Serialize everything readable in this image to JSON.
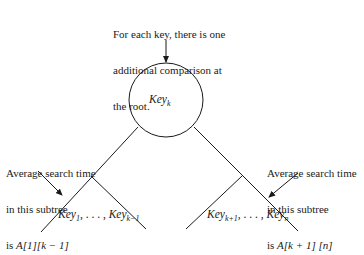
{
  "top_note": {
    "lines": [
      "For each key, there is one",
      "additional comparison at",
      "the root."
    ]
  },
  "root": {
    "base": "Key",
    "sub": "k"
  },
  "left_note": {
    "line1": "Average search time",
    "line2": "in this subtree",
    "line3_prefix": "is ",
    "line3_expr": "A[1][k − 1]"
  },
  "right_note": {
    "line1": "Average search time",
    "line2": "in this subtree",
    "line3_prefix": "is ",
    "line3_expr": "A[k + 1] [n]"
  },
  "left_subtree": {
    "first_base": "Key",
    "first_sub": "1",
    "sep": ", . . . , ",
    "last_base": "Key",
    "last_sub": "k−1"
  },
  "right_subtree": {
    "first_base": "Key",
    "first_sub": "k+1",
    "sep": ", . . . , ",
    "last_base": "Key",
    "last_sub": "n"
  },
  "colors": {
    "ink": "#1a1a1a",
    "background": "#ffffff"
  }
}
